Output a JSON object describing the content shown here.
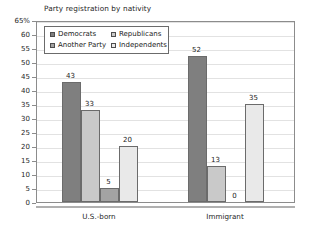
{
  "chart_data": {
    "type": "bar",
    "title": "Party registration by nativity",
    "xlabel": "",
    "ylabel": "",
    "ylim": [
      0,
      65
    ],
    "grid": true,
    "legend_position": "top-left-inside",
    "categories": [
      "U.S.-born",
      "Immigrant"
    ],
    "y_ticks": [
      "65%",
      "60",
      "55",
      "50",
      "45",
      "40",
      "35",
      "30",
      "25",
      "20",
      "15",
      "10",
      "5",
      "0"
    ],
    "y_tick_values": [
      65,
      60,
      55,
      50,
      45,
      40,
      35,
      30,
      25,
      20,
      15,
      10,
      5,
      0
    ],
    "series": [
      {
        "name": "Democrats",
        "values": [
          43,
          52
        ],
        "color": "#7f7f7f"
      },
      {
        "name": "Republicans",
        "values": [
          33,
          13
        ],
        "color": "#c9c9c9"
      },
      {
        "name": "Another Party",
        "values": [
          5,
          0
        ],
        "color": "#a3a3a3"
      },
      {
        "name": "Independents",
        "values": [
          20,
          35
        ],
        "color": "#e9e9e9"
      }
    ],
    "data_labels": {
      "U.S.-born": [
        "43",
        "33",
        "5",
        "20"
      ],
      "Immigrant": [
        "52",
        "13",
        "0",
        "35"
      ]
    }
  },
  "legend": {
    "items": [
      {
        "label": "Democrats"
      },
      {
        "label": "Republicans"
      },
      {
        "label": "Another Party"
      },
      {
        "label": "Independents"
      }
    ]
  },
  "axis": {
    "x_labels": [
      "U.S.-born",
      "Immigrant"
    ]
  }
}
